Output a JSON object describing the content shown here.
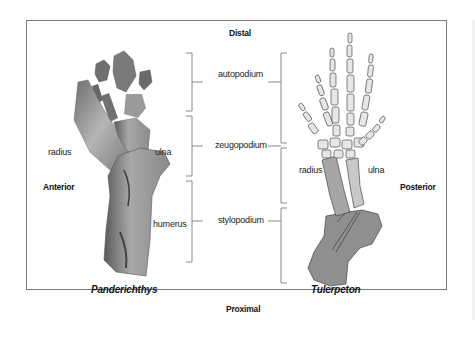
{
  "diagram": {
    "orientation": {
      "top": "Distal",
      "bottom": "Proximal",
      "left": "Anterior",
      "right": "Posterior"
    },
    "segments": [
      {
        "label": "autopodium"
      },
      {
        "label": "zeugopodium"
      },
      {
        "label": "stylopodium"
      }
    ],
    "left_specimen": {
      "name": "Panderichthys",
      "labels": {
        "radius": "radius",
        "ulna": "ulna",
        "humerus": "humerus"
      }
    },
    "right_specimen": {
      "name": "Tulerpeton",
      "labels": {
        "radius": "radius",
        "ulna": "ulna"
      }
    },
    "colors": {
      "frame": "#7a7a7a",
      "bracket": "#8a8a8a",
      "humerus_fill": "#8f8f8f",
      "radius_fill": "#a6a6a6",
      "ulna_fill": "#c8c8c8",
      "digit_fill": "#e6e6e6",
      "bone_outline": "#333333"
    }
  }
}
